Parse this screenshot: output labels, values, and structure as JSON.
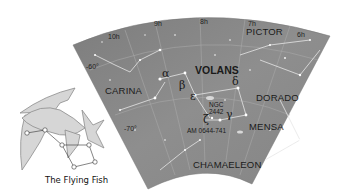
{
  "chart": {
    "title": "VOLANS",
    "constellations": {
      "volans": "VOLANS",
      "carina": "CARINA",
      "pictor": "PICTOR",
      "dorado": "DORADO",
      "mensa": "MENSA",
      "chamaeleon": "CHAMAELEON"
    },
    "ra_labels": [
      "10h",
      "9h",
      "8h",
      "7h",
      "6h"
    ],
    "dec_labels": [
      "-60°",
      "-70°"
    ],
    "stars": {
      "alpha": "α",
      "beta": "β",
      "epsilon": "ε",
      "delta": "δ",
      "gamma": "γ",
      "zeta": "ζ"
    },
    "objects": {
      "ngc_line1": "NGC",
      "ngc_line2": "2442",
      "am": "AM 0644-741"
    },
    "colors": {
      "sky": "#8a8a8a",
      "sky_dark": "#6e6e6e",
      "grid": "#b0b0b0",
      "fish_fill": "#d4d4d4",
      "fish_stroke": "#8c8c8c"
    }
  },
  "illustration": {
    "caption": "The Flying Fish"
  }
}
